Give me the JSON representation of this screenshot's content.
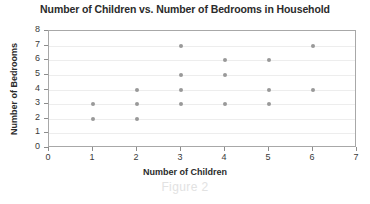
{
  "chart_data": {
    "type": "scatter",
    "title": "Number of Children vs. Number of Bedrooms in Household",
    "xlabel": "Number of Children",
    "ylabel": "Number of Bedrooms",
    "xlim": [
      0,
      7
    ],
    "ylim": [
      0,
      8
    ],
    "xticks": [
      0,
      1,
      2,
      3,
      4,
      5,
      6,
      7
    ],
    "yticks": [
      0,
      1,
      2,
      3,
      4,
      5,
      6,
      7,
      8
    ],
    "grid": "horizontal",
    "legend": null,
    "marker_color": "#999999",
    "points": [
      {
        "x": 1,
        "y": 3
      },
      {
        "x": 1,
        "y": 2
      },
      {
        "x": 2,
        "y": 4
      },
      {
        "x": 2,
        "y": 3
      },
      {
        "x": 2,
        "y": 2
      },
      {
        "x": 3,
        "y": 7
      },
      {
        "x": 3,
        "y": 5
      },
      {
        "x": 3,
        "y": 4
      },
      {
        "x": 3,
        "y": 3
      },
      {
        "x": 4,
        "y": 6
      },
      {
        "x": 4,
        "y": 5
      },
      {
        "x": 4,
        "y": 3
      },
      {
        "x": 5,
        "y": 6
      },
      {
        "x": 5,
        "y": 4
      },
      {
        "x": 5,
        "y": 3
      },
      {
        "x": 6,
        "y": 7
      },
      {
        "x": 6,
        "y": 4
      }
    ]
  },
  "caption": {
    "text": "Figure 2"
  },
  "colors": {
    "marker": "#999999",
    "frame": "#a8a8a8",
    "grid": "#ededed",
    "text": "#2b2b2b",
    "caption": "#e2e2e2"
  }
}
